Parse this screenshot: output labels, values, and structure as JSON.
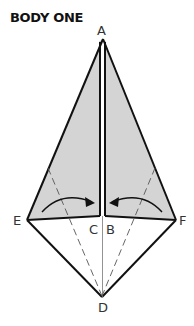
{
  "title": "BODY ONE",
  "labels": {
    "A": "A",
    "B": "B",
    "C": "C",
    "D": "D",
    "E": "E",
    "F": "F"
  },
  "colors": {
    "fill": "#d4d4d4",
    "stroke": "#111111",
    "crease": "#555555",
    "background": "#ffffff"
  },
  "instructions": {
    "arrows": [
      "fold left flap edge toward center",
      "fold right flap edge toward center"
    ],
    "fold_lines": [
      "E-D valley crease (dashed)",
      "F-D valley crease (dashed)",
      "A-D center crease"
    ]
  }
}
